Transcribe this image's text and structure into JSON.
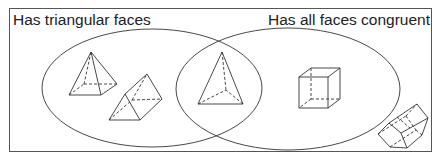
{
  "diagram": {
    "type": "venn",
    "sets": [
      {
        "id": "left",
        "label": "Has triangular faces"
      },
      {
        "id": "right",
        "label": "Has all faces congruent"
      }
    ],
    "regions": {
      "left_only": [
        "square pyramid",
        "triangular prism"
      ],
      "intersection": [
        "tetrahedron"
      ],
      "right_only": [
        "cube"
      ],
      "outside": [
        "pentagonal prism"
      ]
    },
    "colors": {
      "stroke": "#333333",
      "background": "#ffffff"
    }
  }
}
